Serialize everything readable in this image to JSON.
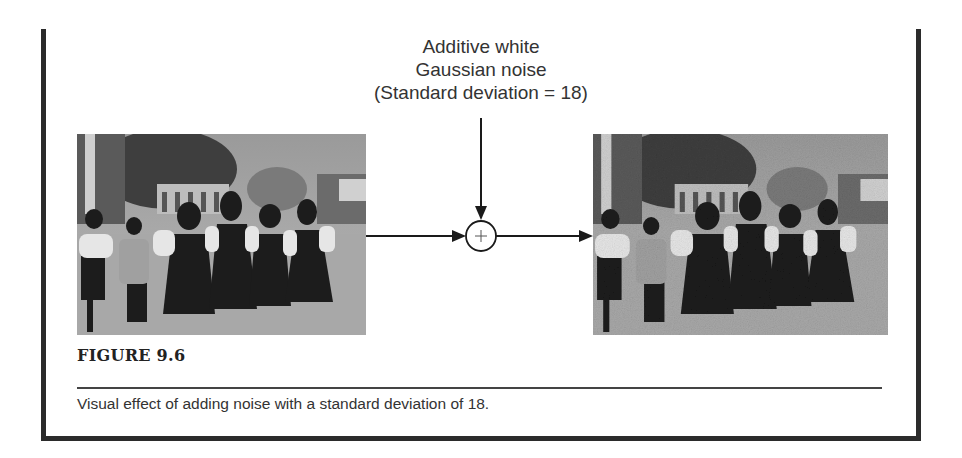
{
  "figure": {
    "noise_label": {
      "line1": "Additive white",
      "line2": "Gaussian noise",
      "line3": "(Standard deviation = 18)"
    },
    "operator_symbol": "+",
    "input_image": "original-photo-group-of-people-in-traditional-dress",
    "output_image": "noisy-photo-group-of-people-in-traditional-dress",
    "title": "FIGURE 9.6",
    "caption": "Visual effect of adding noise with a standard deviation of 18."
  },
  "colors": {
    "frame": "#2b2b2b",
    "text": "#333333",
    "background": "#ffffff"
  }
}
